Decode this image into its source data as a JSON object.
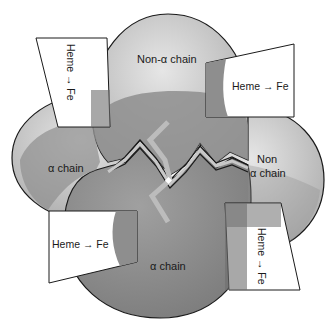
{
  "diagram": {
    "type": "hemoglobin-quaternary-structure",
    "subunits": [
      {
        "id": "alpha-left",
        "label": "α chain"
      },
      {
        "id": "nonalpha-top",
        "label": "Non-α chain"
      },
      {
        "id": "nonalpha-right",
        "label_line1": "Non",
        "label_line2": "α chain"
      },
      {
        "id": "alpha-bottom",
        "label": "α chain"
      }
    ],
    "heme_groups": [
      {
        "id": "heme-top-left",
        "text": "Heme → Fe",
        "orientation": "vertical"
      },
      {
        "id": "heme-top-right",
        "text": "Heme → Fe",
        "orientation": "horizontal"
      },
      {
        "id": "heme-bottom-left",
        "text": "Heme → Fe",
        "orientation": "horizontal"
      },
      {
        "id": "heme-bottom-right",
        "text": "Heme → Fe",
        "orientation": "vertical"
      }
    ],
    "colors": {
      "light_subunit": "#c4c4c4",
      "dark_subunit": "#8a8a8a",
      "overlap": "#7a7a7a",
      "outline": "#1a1a1a",
      "background": "#ffffff"
    }
  }
}
